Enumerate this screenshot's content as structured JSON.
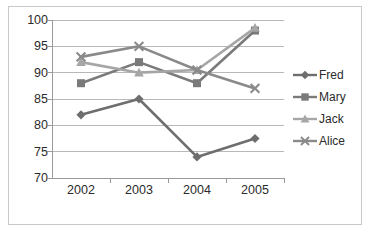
{
  "chart_data": {
    "type": "line",
    "title": "",
    "xlabel": "",
    "ylabel": "",
    "categories": [
      "2002",
      "2003",
      "2004",
      "2005"
    ],
    "ylim": [
      70,
      100
    ],
    "yticks": [
      70,
      75,
      80,
      85,
      90,
      95,
      100
    ],
    "grid": true,
    "legend_position": "right",
    "series": [
      {
        "name": "Fred",
        "marker": "diamond",
        "color": "#6E6E6E",
        "values": [
          82,
          85,
          74,
          77.5
        ]
      },
      {
        "name": "Mary",
        "marker": "square",
        "color": "#7A7A7A",
        "values": [
          88,
          92,
          88,
          98
        ]
      },
      {
        "name": "Jack",
        "marker": "triangle",
        "color": "#A6A6A6",
        "values": [
          92,
          90,
          90.5,
          98.5
        ]
      },
      {
        "name": "Alice",
        "marker": "x",
        "color": "#8A8A8A",
        "values": [
          93,
          95,
          90.5,
          87
        ]
      }
    ]
  },
  "axis": {
    "y_tick_labels": [
      "100",
      "95",
      "90",
      "85",
      "80",
      "75",
      "70"
    ],
    "x_tick_labels": [
      "2002",
      "2003",
      "2004",
      "2005"
    ]
  },
  "legend": {
    "items": [
      {
        "label": "Fred"
      },
      {
        "label": "Mary"
      },
      {
        "label": "Jack"
      },
      {
        "label": "Alice"
      }
    ]
  }
}
